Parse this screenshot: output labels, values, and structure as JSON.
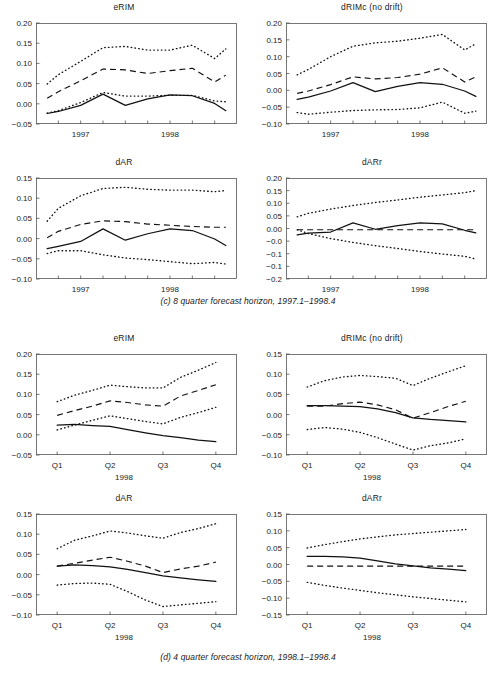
{
  "figure": {
    "width": 496,
    "height": 673,
    "background": "#ffffff",
    "ink": "#111111",
    "axis_color": "#555555"
  },
  "captions": {
    "c": "(c) 8 quarter forecast horizon, 1997.1–1998.4",
    "d": "(d) 4 quarter forecast horizon, 1998.1–1998.4"
  },
  "legend_semantics": {
    "solid": "actual / realised outcome",
    "dashed": "central forecast",
    "dotted": "forecast interval bounds"
  },
  "chart_data": [
    {
      "id": "c-erim",
      "type": "line",
      "title": "eRIM",
      "panel_group": "(c) 8 quarter forecast horizon, 1997.1–1998.4",
      "xlabel": "",
      "ylabel": "",
      "xlim": [
        0,
        9
      ],
      "ylim": [
        -0.05,
        0.2
      ],
      "yticks": [
        0.2,
        0.15,
        0.1,
        0.05,
        0.0,
        -0.05
      ],
      "yticklabels": [
        "0.20",
        "0.15",
        "0.10",
        "0.05",
        "0.00",
        "−0.05"
      ],
      "xticks": [
        2,
        6
      ],
      "xticklabels": [
        "1997",
        "1998"
      ],
      "xminorticks": [
        1,
        2,
        3,
        4,
        5,
        6,
        7,
        8
      ],
      "x": [
        0.5,
        1,
        2,
        3,
        4,
        5,
        6,
        7,
        8,
        8.5
      ],
      "series": [
        {
          "name": "upper band",
          "style": "dotted",
          "values": [
            0.049,
            0.072,
            0.105,
            0.139,
            0.142,
            0.133,
            0.133,
            0.145,
            0.112,
            0.136
          ]
        },
        {
          "name": "central forecast",
          "style": "dashed",
          "values": [
            0.014,
            0.03,
            0.057,
            0.086,
            0.084,
            0.075,
            0.082,
            0.088,
            0.054,
            0.071
          ]
        },
        {
          "name": "lower band",
          "style": "dotted",
          "values": [
            -0.023,
            -0.017,
            0.003,
            0.028,
            0.019,
            0.019,
            0.021,
            0.021,
            0.007,
            0.005
          ]
        },
        {
          "name": "actual",
          "style": "solid",
          "values": [
            -0.024,
            -0.019,
            -0.004,
            0.024,
            -0.004,
            0.012,
            0.022,
            0.02,
            0.001,
            -0.017
          ]
        }
      ]
    },
    {
      "id": "c-drimc",
      "type": "line",
      "title": "dRIMc (no drift)",
      "panel_group": "(c) 8 quarter forecast horizon, 1997.1–1998.4",
      "xlabel": "",
      "ylabel": "",
      "xlim": [
        0,
        9
      ],
      "ylim": [
        -0.1,
        0.2
      ],
      "yticks": [
        0.2,
        0.15,
        0.1,
        0.05,
        0.0,
        -0.05,
        -0.1
      ],
      "yticklabels": [
        "0.20",
        "0.15",
        "0.10",
        "0.05",
        "0.00",
        "−0.05",
        "−0.10"
      ],
      "xticks": [
        2,
        6
      ],
      "xticklabels": [
        "1997",
        "1998"
      ],
      "xminorticks": [
        1,
        2,
        3,
        4,
        5,
        6,
        7,
        8
      ],
      "x": [
        0.5,
        1,
        2,
        3,
        4,
        5,
        6,
        7,
        8,
        8.5
      ],
      "series": [
        {
          "name": "upper band",
          "style": "dotted",
          "values": [
            0.046,
            0.062,
            0.1,
            0.131,
            0.141,
            0.146,
            0.155,
            0.166,
            0.12,
            0.138
          ]
        },
        {
          "name": "central forecast",
          "style": "dashed",
          "values": [
            -0.009,
            -0.002,
            0.017,
            0.04,
            0.034,
            0.038,
            0.048,
            0.067,
            0.025,
            0.04
          ]
        },
        {
          "name": "actual",
          "style": "solid",
          "values": [
            -0.027,
            -0.02,
            -0.002,
            0.023,
            -0.004,
            0.012,
            0.023,
            0.018,
            -0.002,
            -0.018
          ]
        },
        {
          "name": "lower band",
          "style": "dotted",
          "values": [
            -0.066,
            -0.071,
            -0.065,
            -0.06,
            -0.058,
            -0.057,
            -0.052,
            -0.035,
            -0.068,
            -0.062
          ]
        }
      ]
    },
    {
      "id": "c-dar",
      "type": "line",
      "title": "dAR",
      "panel_group": "(c) 8 quarter forecast horizon, 1997.1–1998.4",
      "xlabel": "",
      "ylabel": "",
      "xlim": [
        0,
        9
      ],
      "ylim": [
        -0.1,
        0.15
      ],
      "yticks": [
        0.15,
        0.1,
        0.05,
        0.0,
        -0.05,
        -0.1
      ],
      "yticklabels": [
        "0.15",
        "0.10",
        "0.05",
        "0.00",
        "−0.05",
        "−0.10"
      ],
      "xticks": [
        2,
        6
      ],
      "xticklabels": [
        "1997",
        "1998"
      ],
      "xminorticks": [
        1,
        2,
        3,
        4,
        5,
        6,
        7,
        8
      ],
      "x": [
        0.5,
        1,
        2,
        3,
        4,
        5,
        6,
        7,
        8,
        8.5
      ],
      "series": [
        {
          "name": "upper band",
          "style": "dotted",
          "values": [
            0.043,
            0.075,
            0.106,
            0.124,
            0.127,
            0.122,
            0.12,
            0.12,
            0.116,
            0.119
          ]
        },
        {
          "name": "central forecast",
          "style": "dashed",
          "values": [
            0.002,
            0.018,
            0.035,
            0.044,
            0.042,
            0.036,
            0.033,
            0.03,
            0.028,
            0.028
          ]
        },
        {
          "name": "actual",
          "style": "solid",
          "values": [
            -0.025,
            -0.019,
            -0.007,
            0.024,
            -0.004,
            0.012,
            0.024,
            0.02,
            -0.001,
            -0.017
          ]
        },
        {
          "name": "lower band",
          "style": "dotted",
          "values": [
            -0.037,
            -0.03,
            -0.03,
            -0.04,
            -0.048,
            -0.052,
            -0.057,
            -0.062,
            -0.059,
            -0.063
          ]
        }
      ]
    },
    {
      "id": "c-darr",
      "type": "line",
      "title": "dARr",
      "panel_group": "(c) 8 quarter forecast horizon, 1997.1–1998.4",
      "xlabel": "",
      "ylabel": "",
      "xlim": [
        0,
        9
      ],
      "ylim": [
        -0.2,
        0.2
      ],
      "yticks": [
        0.2,
        0.15,
        0.1,
        0.05,
        0.0,
        -0.05,
        -0.1,
        -0.15,
        -0.2
      ],
      "yticklabels": [
        "0.20",
        "0.15",
        "0.10",
        "0.05",
        "0.00",
        "−0.0",
        "−0.1",
        "−0.1",
        "−0.2"
      ],
      "xticks": [
        2,
        6
      ],
      "xticklabels": [
        "1997",
        "1998"
      ],
      "xminorticks": [
        1,
        2,
        3,
        4,
        5,
        6,
        7,
        8
      ],
      "x": [
        0.5,
        1,
        2,
        3,
        4,
        5,
        6,
        7,
        8,
        8.5
      ],
      "series": [
        {
          "name": "upper band",
          "style": "dotted",
          "values": [
            0.046,
            0.06,
            0.077,
            0.091,
            0.103,
            0.113,
            0.124,
            0.133,
            0.142,
            0.15
          ]
        },
        {
          "name": "central forecast",
          "style": "dashed",
          "values": [
            -0.005,
            -0.005,
            -0.005,
            -0.005,
            -0.005,
            -0.005,
            -0.005,
            -0.005,
            -0.005,
            -0.005
          ]
        },
        {
          "name": "actual",
          "style": "solid",
          "values": [
            -0.025,
            -0.018,
            -0.014,
            0.022,
            -0.003,
            0.011,
            0.022,
            0.018,
            -0.007,
            -0.017
          ]
        },
        {
          "name": "lower band",
          "style": "dotted",
          "values": [
            -0.005,
            -0.02,
            -0.04,
            -0.055,
            -0.068,
            -0.079,
            -0.091,
            -0.101,
            -0.11,
            -0.121
          ]
        }
      ]
    },
    {
      "id": "d-erim",
      "type": "line",
      "title": "eRIM",
      "panel_group": "(d) 4 quarter forecast horizon, 1998.1–1998.4",
      "xlabel": "1998",
      "ylabel": "",
      "xlim": [
        0.6,
        4.4
      ],
      "ylim": [
        -0.05,
        0.2
      ],
      "yticks": [
        0.2,
        0.15,
        0.1,
        0.05,
        0.0,
        -0.05
      ],
      "yticklabels": [
        "0.20",
        "0.15",
        "0.10",
        "0.05",
        "0.00",
        "−0.05"
      ],
      "xticks": [
        1,
        2,
        3,
        4
      ],
      "xticklabels": [
        "Q1",
        "Q2",
        "Q3",
        "Q4"
      ],
      "xminorticks": [
        1,
        2,
        3,
        4
      ],
      "x": [
        1,
        1.33,
        1.67,
        2,
        2.33,
        2.67,
        3,
        3.33,
        3.67,
        4
      ],
      "series": [
        {
          "name": "upper band",
          "style": "dotted",
          "values": [
            0.082,
            0.098,
            0.11,
            0.123,
            0.119,
            0.116,
            0.116,
            0.142,
            0.16,
            0.179
          ]
        },
        {
          "name": "central forecast",
          "style": "dashed",
          "values": [
            0.048,
            0.06,
            0.071,
            0.084,
            0.08,
            0.074,
            0.071,
            0.096,
            0.11,
            0.124
          ]
        },
        {
          "name": "lower band",
          "style": "dotted",
          "values": [
            0.012,
            0.024,
            0.036,
            0.047,
            0.04,
            0.033,
            0.027,
            0.043,
            0.055,
            0.068
          ]
        },
        {
          "name": "actual",
          "style": "solid",
          "values": [
            0.024,
            0.026,
            0.023,
            0.021,
            0.013,
            0.005,
            -0.002,
            -0.007,
            -0.013,
            -0.017
          ]
        }
      ]
    },
    {
      "id": "d-drimc",
      "type": "line",
      "title": "dRIMc (no drift)",
      "panel_group": "(d) 4 quarter forecast horizon, 1998.1–1998.4",
      "xlabel": "1998",
      "ylabel": "",
      "xlim": [
        0.6,
        4.4
      ],
      "ylim": [
        -0.1,
        0.15
      ],
      "yticks": [
        0.15,
        0.1,
        0.05,
        0.0,
        -0.05,
        -0.1
      ],
      "yticklabels": [
        "0.15",
        "0.10",
        "0.05",
        "0.00",
        "−0.05",
        "−0.10"
      ],
      "xticks": [
        1,
        2,
        3,
        4
      ],
      "xticklabels": [
        "Q1",
        "Q2",
        "Q3",
        "Q4"
      ],
      "xminorticks": [
        1,
        2,
        3,
        4
      ],
      "x": [
        1,
        1.33,
        1.67,
        2,
        2.33,
        2.67,
        3,
        3.33,
        3.67,
        4
      ],
      "series": [
        {
          "name": "upper band",
          "style": "dotted",
          "values": [
            0.068,
            0.084,
            0.093,
            0.097,
            0.094,
            0.09,
            0.072,
            0.09,
            0.106,
            0.121
          ]
        },
        {
          "name": "central forecast",
          "style": "dashed",
          "values": [
            0.021,
            0.021,
            0.027,
            0.031,
            0.024,
            0.012,
            -0.009,
            0.005,
            0.02,
            0.033
          ]
        },
        {
          "name": "actual",
          "style": "solid",
          "values": [
            0.022,
            0.022,
            0.021,
            0.02,
            0.014,
            0.005,
            -0.008,
            -0.012,
            -0.015,
            -0.018
          ]
        },
        {
          "name": "lower band",
          "style": "dotted",
          "values": [
            -0.037,
            -0.032,
            -0.036,
            -0.044,
            -0.057,
            -0.073,
            -0.088,
            -0.077,
            -0.07,
            -0.06
          ]
        }
      ]
    },
    {
      "id": "d-dar",
      "type": "line",
      "title": "dAR",
      "panel_group": "(d) 4 quarter forecast horizon, 1998.1–1998.4",
      "xlabel": "1998",
      "ylabel": "",
      "xlim": [
        0.6,
        4.4
      ],
      "ylim": [
        -0.1,
        0.15
      ],
      "yticks": [
        0.15,
        0.1,
        0.05,
        0.0,
        -0.05,
        -0.1
      ],
      "yticklabels": [
        "0.15",
        "0.10",
        "0.05",
        "0.00",
        "−0.05",
        "−0.10"
      ],
      "xticks": [
        1,
        2,
        3,
        4
      ],
      "xticklabels": [
        "Q1",
        "Q2",
        "Q3",
        "Q4"
      ],
      "xminorticks": [
        1,
        2,
        3,
        4
      ],
      "x": [
        1,
        1.33,
        1.67,
        2,
        2.33,
        2.67,
        3,
        3.33,
        3.67,
        4
      ],
      "series": [
        {
          "name": "upper band",
          "style": "dotted",
          "values": [
            0.064,
            0.085,
            0.096,
            0.108,
            0.103,
            0.096,
            0.09,
            0.104,
            0.114,
            0.126
          ]
        },
        {
          "name": "central forecast",
          "style": "dashed",
          "values": [
            0.021,
            0.028,
            0.036,
            0.043,
            0.033,
            0.021,
            0.005,
            0.014,
            0.021,
            0.031
          ]
        },
        {
          "name": "actual",
          "style": "solid",
          "values": [
            0.021,
            0.024,
            0.022,
            0.019,
            0.013,
            0.005,
            -0.003,
            -0.008,
            -0.013,
            -0.017
          ]
        },
        {
          "name": "lower band",
          "style": "dotted",
          "values": [
            -0.026,
            -0.022,
            -0.021,
            -0.024,
            -0.042,
            -0.063,
            -0.079,
            -0.075,
            -0.071,
            -0.067
          ]
        }
      ]
    },
    {
      "id": "d-darr",
      "type": "line",
      "title": "dARr",
      "panel_group": "(d) 4 quarter forecast horizon, 1998.1–1998.4",
      "xlabel": "1998",
      "ylabel": "",
      "xlim": [
        0.6,
        4.4
      ],
      "ylim": [
        -0.15,
        0.15
      ],
      "yticks": [
        0.15,
        0.1,
        0.05,
        0.0,
        -0.05,
        -0.1,
        -0.15
      ],
      "yticklabels": [
        "0.15",
        "0.10",
        "0.05",
        "0.00",
        "−0.05",
        "−0.10",
        "−0.15"
      ],
      "xticks": [
        1,
        2,
        3,
        4
      ],
      "xticklabels": [
        "Q1",
        "Q2",
        "Q3",
        "Q4"
      ],
      "xminorticks": [
        1,
        2,
        3,
        4
      ],
      "x": [
        1,
        1.33,
        1.67,
        2,
        2.33,
        2.67,
        3,
        3.33,
        3.67,
        4
      ],
      "series": [
        {
          "name": "upper band",
          "style": "dotted",
          "values": [
            0.049,
            0.059,
            0.068,
            0.076,
            0.082,
            0.088,
            0.092,
            0.096,
            0.1,
            0.104
          ]
        },
        {
          "name": "central forecast",
          "style": "dashed",
          "values": [
            -0.005,
            -0.005,
            -0.005,
            -0.005,
            -0.005,
            -0.005,
            -0.005,
            -0.005,
            -0.005,
            -0.005
          ]
        },
        {
          "name": "actual",
          "style": "solid",
          "values": [
            0.024,
            0.024,
            0.023,
            0.019,
            0.011,
            0.002,
            -0.004,
            -0.01,
            -0.014,
            -0.018
          ]
        },
        {
          "name": "lower band",
          "style": "dotted",
          "values": [
            -0.053,
            -0.062,
            -0.07,
            -0.077,
            -0.084,
            -0.09,
            -0.096,
            -0.101,
            -0.106,
            -0.111
          ]
        }
      ]
    }
  ]
}
